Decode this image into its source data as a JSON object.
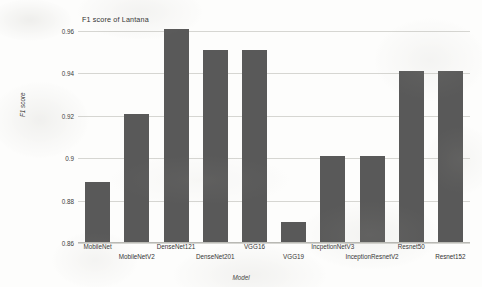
{
  "chart_data": {
    "type": "bar",
    "title": "F1 score of Lantana",
    "xlabel": "Model",
    "ylabel": "F1 score",
    "categories": [
      "MobileNet",
      "MobileNetV2",
      "DenseNet121",
      "DenseNet201",
      "VGG16",
      "VGG19",
      "IncpetionNetV3",
      "InceptionResnetV2",
      "Resnet50",
      "Resnet152"
    ],
    "values": [
      0.889,
      0.921,
      0.961,
      0.951,
      0.951,
      0.87,
      0.901,
      0.901,
      0.941,
      0.941
    ],
    "ylim": [
      0.86,
      0.96
    ],
    "yticks": [
      0.86,
      0.88,
      0.9,
      0.92,
      0.94,
      0.96
    ],
    "ytick_labels": [
      "0.86",
      "0.88",
      "0.9",
      "0.92",
      "0.94",
      "0.96"
    ],
    "grid": true,
    "legend": false,
    "bar_color": "#595959",
    "grid_color": "#d6d6d2",
    "background_color": "#fdfdfc"
  }
}
